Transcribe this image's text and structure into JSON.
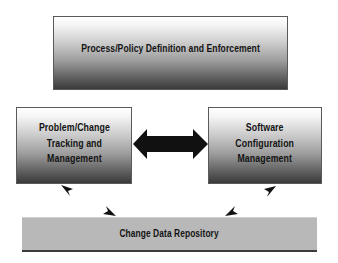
{
  "diagram": {
    "boxes": {
      "top": {
        "label": "Process/Policy Definition and Enforcement"
      },
      "left": {
        "label": "Problem/Change\nTracking and\nManagement"
      },
      "right": {
        "label": "Software\nConfiguration\nManagement"
      },
      "bottom": {
        "label": "Change Data Repository"
      }
    },
    "connectors": [
      {
        "from": "left",
        "to": "right",
        "type": "double-arrow"
      },
      {
        "from": "left",
        "to": "bottom",
        "type": "bidirectional-arrowheads"
      },
      {
        "from": "right",
        "to": "bottom",
        "type": "bidirectional-arrowheads"
      }
    ],
    "colors": {
      "arrow": "#111111",
      "box_border": "#5a5a5a",
      "repository_fill": "#b8b8b8"
    }
  }
}
